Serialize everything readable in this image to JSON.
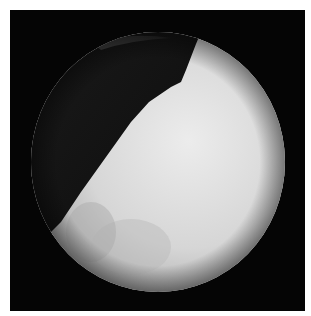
{
  "image": {
    "subject": "endoscopic circular field of view",
    "colors": {
      "background": "#ffffff",
      "frame": "#050505",
      "tissue_light": "#e6e6e6",
      "tissue_mid": "#bdbdbd",
      "dark_region": "#101010"
    }
  }
}
